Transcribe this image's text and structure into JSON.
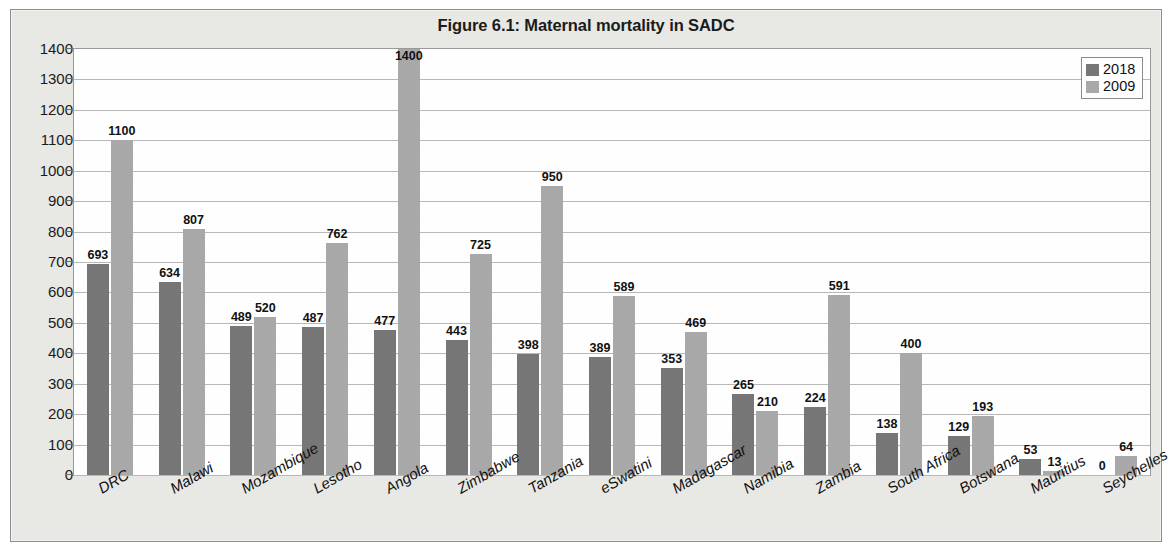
{
  "figure": {
    "title": "Figure 6.1: Maternal mortality in SADC"
  },
  "legend": {
    "position": "top-right",
    "items": [
      {
        "label": "2018",
        "color": "#777777"
      },
      {
        "label": "2009",
        "color": "#a9a9a9"
      }
    ]
  },
  "axis": {
    "y_ticks": [
      "1400",
      "1300",
      "1200",
      "1100",
      "1000",
      "900",
      "800",
      "700",
      "600",
      "500",
      "400",
      "300",
      "200",
      "100",
      "0"
    ]
  },
  "chart_data": {
    "type": "bar",
    "title": "Figure 6.1: Maternal mortality in SADC",
    "xlabel": "",
    "ylabel": "",
    "ylim": [
      0,
      1400
    ],
    "ytick_step": 100,
    "grid": true,
    "legend_position": "top-right",
    "categories": [
      "DRC",
      "Malawi",
      "Mozambique",
      "Lesotho",
      "Angola",
      "Zimbabwe",
      "Tanzania",
      "eSwatini",
      "Madagascar",
      "Namibia",
      "Zambia",
      "South Africa",
      "Botswana",
      "Mauritius",
      "Seychelles"
    ],
    "series": [
      {
        "name": "2018",
        "color": "#777777",
        "values": [
          693,
          634,
          489,
          487,
          477,
          443,
          398,
          389,
          353,
          265,
          224,
          138,
          129,
          53,
          0
        ]
      },
      {
        "name": "2009",
        "color": "#a9a9a9",
        "values": [
          1100,
          807,
          520,
          762,
          1400,
          725,
          950,
          589,
          469,
          210,
          591,
          400,
          193,
          13,
          64
        ]
      }
    ]
  }
}
